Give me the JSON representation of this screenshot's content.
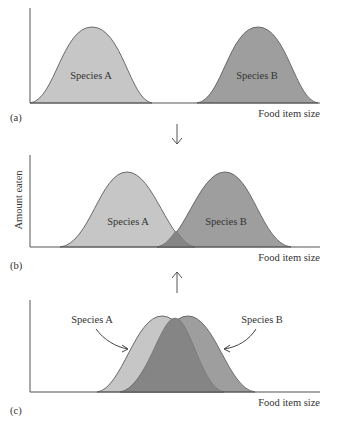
{
  "figure": {
    "colors": {
      "species_a_fill": "#c6c6c6",
      "species_b_fill": "#9e9e9e",
      "overlap_fill": "#858585",
      "outline": "#6a6a6a",
      "axis": "#555555"
    },
    "y_axis_label": "Amount eaten",
    "panels": [
      {
        "id": "a",
        "label": "(a)",
        "x_axis_label": "Food item size",
        "species_a_label": "Species A",
        "species_b_label": "Species B"
      },
      {
        "id": "b",
        "label": "(b)",
        "x_axis_label": "Food item size",
        "species_a_label": "Species A",
        "species_b_label": "Species B"
      },
      {
        "id": "c",
        "label": "(c)",
        "x_axis_label": "Food item size",
        "species_a_label": "Species A",
        "species_b_label": "Species B"
      }
    ],
    "arrows": [
      {
        "from": "a",
        "to": "b",
        "direction": "down"
      },
      {
        "from": "c",
        "to": "b",
        "direction": "up"
      }
    ]
  }
}
